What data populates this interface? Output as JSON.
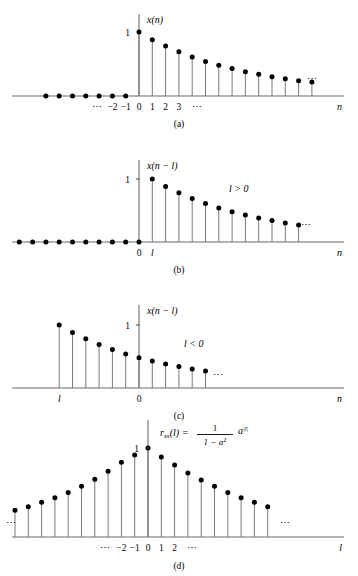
{
  "figure": {
    "kind": "stem-plot-figure",
    "background": "#ffffff",
    "dot_color": "#000000",
    "stem_color": "#7a7a7a",
    "axis_color": "#6b6b6b"
  },
  "panels": [
    {
      "id": "a",
      "caption": "(a)",
      "y_axis_label": "x(n)",
      "x_axis_label": "n",
      "one_label": "1",
      "annotation": "",
      "tick_labels": [
        "⋯",
        "−2",
        "−1",
        "0",
        "1",
        "2",
        "3",
        "⋯"
      ],
      "right_ellipsis": "⋯",
      "left_ellipsis": ""
    },
    {
      "id": "b",
      "caption": "(b)",
      "y_axis_label": "x(n − l)",
      "x_axis_label": "n",
      "one_label": "1",
      "annotation": "l > 0",
      "tick_labels": [
        "0",
        "l"
      ],
      "right_ellipsis": "⋯",
      "left_ellipsis": ""
    },
    {
      "id": "c",
      "caption": "(c)",
      "y_axis_label": "x(n − l)",
      "x_axis_label": "n",
      "one_label": "1",
      "annotation": "l < 0",
      "tick_labels": [
        "l",
        "0"
      ],
      "right_ellipsis": "⋯",
      "left_ellipsis": ""
    },
    {
      "id": "d",
      "caption": "(d)",
      "y_axis_label": "r_xx(l)",
      "x_axis_label": "l",
      "one_label": "1",
      "annotation": "",
      "tick_labels": [
        "⋯",
        "−2",
        "−1",
        "0",
        "1",
        "2",
        "⋯"
      ],
      "right_ellipsis": "⋯",
      "left_ellipsis": "⋯",
      "formula": {
        "lhs": "r",
        "lhs_sub": "xx",
        "lhs_arg": "(l) =",
        "numerator": "1",
        "denominator_a": "1 − a",
        "denominator_sup": "2",
        "factor": "a",
        "factor_sup": "|l|"
      }
    }
  ],
  "chart_data": {
    "type": "line",
    "xlabel": "n / l",
    "ylabel": "amplitude",
    "ylim": [
      0,
      1.05
    ],
    "decay_ratio": 0.88,
    "series": [
      {
        "name": "panel-a x(n) = a^n u(n)",
        "panel": "a",
        "x": [
          -7,
          -6,
          -5,
          -4,
          -3,
          -2,
          -1,
          0,
          1,
          2,
          3,
          4,
          5,
          6,
          7,
          8,
          9,
          10,
          11,
          12,
          13
        ],
        "values": [
          0,
          0,
          0,
          0,
          0,
          0,
          0,
          1.0,
          0.88,
          0.78,
          0.69,
          0.61,
          0.54,
          0.48,
          0.43,
          0.38,
          0.34,
          0.3,
          0.27,
          0.24,
          0.22
        ]
      },
      {
        "name": "panel-b x(n-l), l>0",
        "panel": "b",
        "x": [
          -9,
          -8,
          -7,
          -6,
          -5,
          -4,
          -3,
          -2,
          -1,
          0,
          1,
          2,
          3,
          4,
          5,
          6,
          7,
          8,
          9,
          10,
          11,
          12
        ],
        "values": [
          0,
          0,
          0,
          0,
          0,
          0,
          0,
          0,
          0,
          0,
          1.0,
          0.88,
          0.78,
          0.69,
          0.61,
          0.54,
          0.48,
          0.43,
          0.38,
          0.34,
          0.3,
          0.27
        ]
      },
      {
        "name": "panel-c x(n-l), l<0",
        "panel": "c",
        "x": [
          -6,
          -5,
          -4,
          -3,
          -2,
          -1,
          0,
          1,
          2,
          3,
          4,
          5
        ],
        "values": [
          1.0,
          0.88,
          0.78,
          0.69,
          0.61,
          0.54,
          0.48,
          0.43,
          0.38,
          0.34,
          0.3,
          0.27
        ]
      },
      {
        "name": "panel-d r_xx(l)",
        "panel": "d",
        "x": [
          -10,
          -9,
          -8,
          -7,
          -6,
          -5,
          -4,
          -3,
          -2,
          -1,
          0,
          1,
          2,
          3,
          4,
          5,
          6,
          7,
          8,
          9
        ],
        "values": [
          0.3,
          0.34,
          0.39,
          0.44,
          0.5,
          0.57,
          0.65,
          0.74,
          0.84,
          0.92,
          1.0,
          0.9,
          0.81,
          0.72,
          0.64,
          0.57,
          0.5,
          0.44,
          0.39,
          0.34
        ]
      }
    ]
  }
}
